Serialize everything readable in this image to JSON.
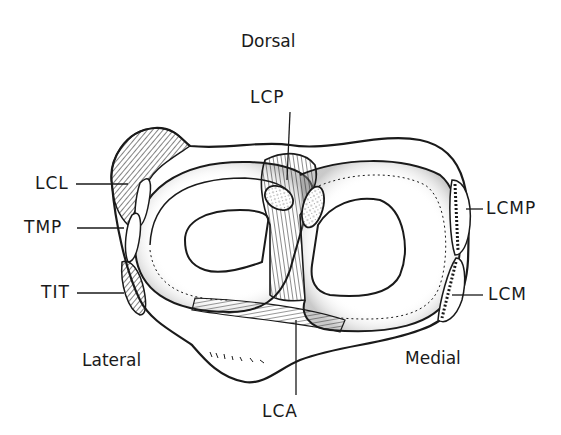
{
  "orientation": {
    "top": "Dorsal",
    "left": "Lateral",
    "right": "Medial"
  },
  "labels": {
    "lcp": "LCP",
    "lcl": "LCL",
    "tmp": "TMP",
    "tit": "TIT",
    "lcmp": "LCMP",
    "lcm": "LCM",
    "lca": "LCA"
  },
  "colors": {
    "ink": "#1a1a1a",
    "background": "#ffffff"
  }
}
